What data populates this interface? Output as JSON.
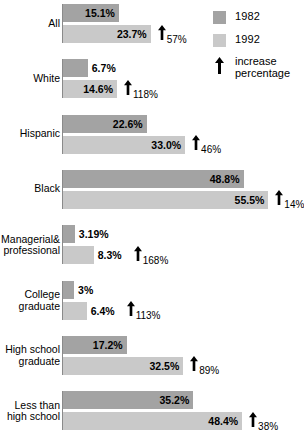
{
  "chart_data": {
    "type": "bar",
    "orientation": "horizontal",
    "title": "",
    "xlabel": "",
    "ylabel": "",
    "grid": false,
    "axis_range": [
      0,
      60
    ],
    "legend_position": "top-right",
    "categories": [
      "All",
      "White",
      "Hispanic",
      "Black",
      "Managerial&\nprofessional",
      "College\ngraduate",
      "High school\ngraduate",
      "Less than\nhigh school"
    ],
    "series": [
      {
        "name": "1982",
        "color": "#a3a3a3",
        "values": [
          15.1,
          6.7,
          22.6,
          48.8,
          3.19,
          3,
          17.2,
          35.2
        ],
        "labels": [
          "15.1%",
          "6.7%",
          "22.6%",
          "48.8%",
          "3.19%",
          "3%",
          "17.2%",
          "35.2%"
        ]
      },
      {
        "name": "1992",
        "color": "#c9c9c9",
        "values": [
          23.7,
          14.6,
          33.0,
          55.5,
          8.3,
          6.4,
          32.5,
          48.4
        ],
        "labels": [
          "23.7%",
          "14.6%",
          "33.0%",
          "55.5%",
          "8.3%",
          "6.4%",
          "32.5%",
          "48.4%"
        ]
      }
    ],
    "annotations": {
      "name": "increase percentage",
      "icon": "up-arrow-icon",
      "values": [
        "57%",
        "118%",
        "46%",
        "14%",
        "168%",
        "113%",
        "89%",
        "38%"
      ]
    }
  },
  "legend": {
    "items": [
      {
        "label": "1982",
        "color": "#a3a3a3",
        "swatch": "legend-swatch-1982"
      },
      {
        "label": "1992",
        "color": "#c9c9c9",
        "swatch": "legend-swatch-1992"
      }
    ],
    "arrow_entry": {
      "icon": "up-arrow-icon",
      "line1": "increase",
      "line2": "percentage"
    }
  },
  "source": {
    "text": ""
  }
}
